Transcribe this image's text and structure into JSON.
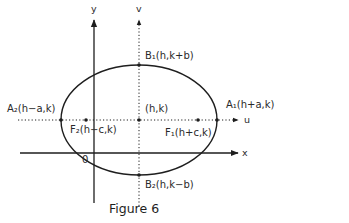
{
  "figure": {
    "caption": "Figure 6",
    "axes": {
      "x_label": "x",
      "y_label": "y",
      "u_label": "u",
      "v_label": "v",
      "origin_label": "0"
    },
    "center_label": "(h,k)",
    "points": [
      {
        "id": "A1",
        "label": "A₁(h+a,k)"
      },
      {
        "id": "A2",
        "label": "A₂(h−a,k)"
      },
      {
        "id": "B1",
        "label": "B₁(h,k+b)"
      },
      {
        "id": "B2",
        "label": "B₂(h,k−b)"
      },
      {
        "id": "F1",
        "label": "F₁(h+c,k)"
      },
      {
        "id": "F2",
        "label": "F₂(h−c,k)"
      }
    ],
    "colors": {
      "ink": "#1e1e1e",
      "background": "#ffffff"
    }
  }
}
